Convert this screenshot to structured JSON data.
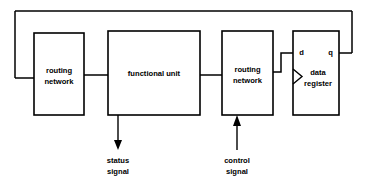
{
  "diagram": {
    "blocks": [
      {
        "id": "routing_network_left",
        "label_line1": "routing",
        "label_line2": "network"
      },
      {
        "id": "functional_unit",
        "label_line1": "functional unit",
        "label_line2": ""
      },
      {
        "id": "routing_network_right",
        "label_line1": "routing",
        "label_line2": "network"
      },
      {
        "id": "data_register",
        "label_line1": "data",
        "label_line2": "register"
      }
    ],
    "ports": {
      "data_input": "d",
      "data_output": "q"
    },
    "signals": [
      {
        "id": "status_signal",
        "label_line1": "status",
        "label_line2": "signal",
        "direction": "out"
      },
      {
        "id": "control_signal",
        "label_line1": "control",
        "label_line2": "signal",
        "direction": "in"
      }
    ],
    "colors": {
      "line": "#000000",
      "background": "#ffffff",
      "text": "#000000"
    }
  }
}
